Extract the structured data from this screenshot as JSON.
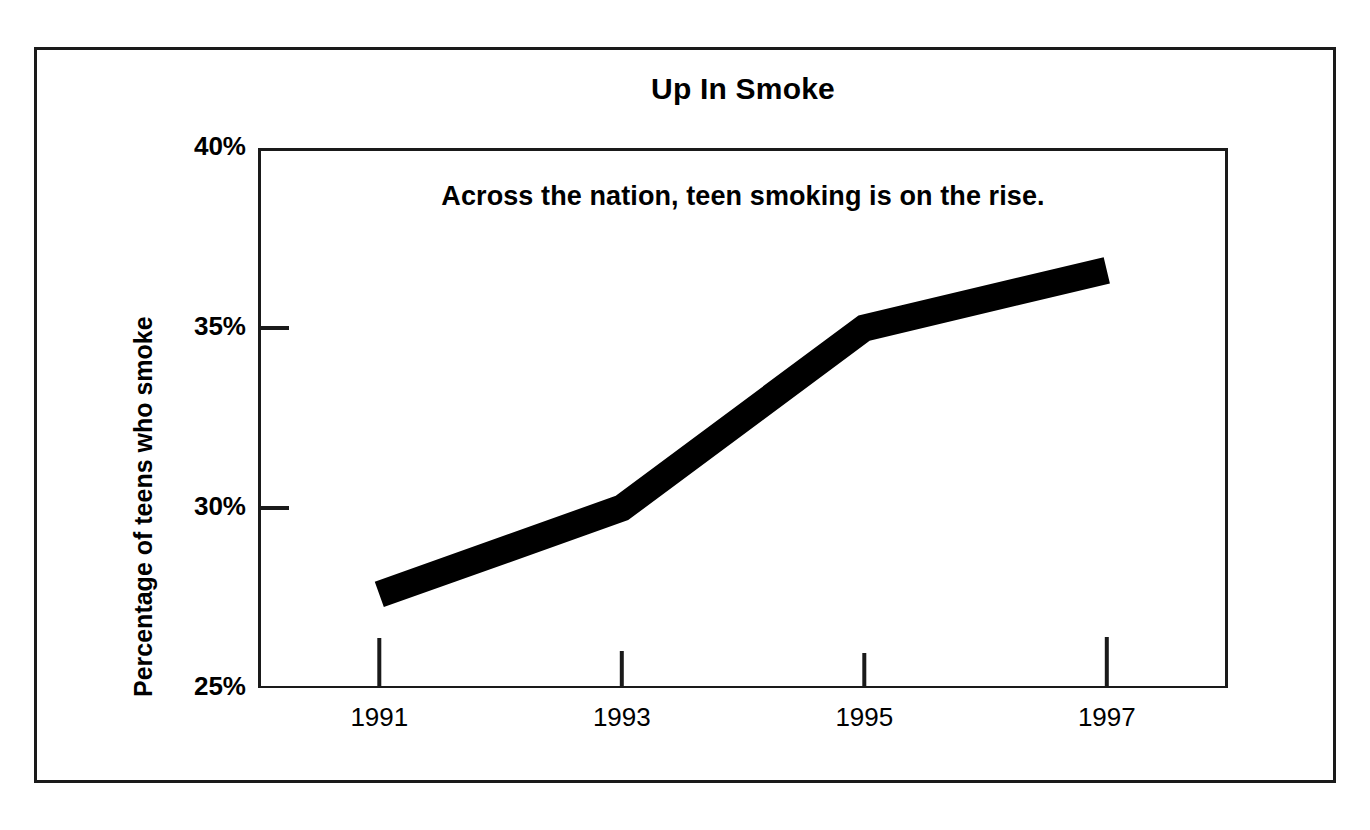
{
  "chart_data": {
    "type": "line",
    "title": "Up In Smoke",
    "annotation": "Across the nation, teen smoking is on the rise.",
    "xlabel": "",
    "ylabel": "Percentage of teens who smoke",
    "x": [
      1991,
      1993,
      1995,
      1997
    ],
    "categories": [
      "1991",
      "1993",
      "1995",
      "1997"
    ],
    "values": [
      27.6,
      30.0,
      35.0,
      36.6
    ],
    "series": [
      {
        "name": "Percentage of teens who smoke",
        "values": [
          27.6,
          30.0,
          35.0,
          36.6
        ]
      }
    ],
    "xlim": [
      1990.0,
      1998.0
    ],
    "ylim": [
      25,
      40
    ],
    "ytick_labels": [
      "40%",
      "35%",
      "30%",
      "25%"
    ],
    "ytick_values": [
      40,
      35,
      30,
      25
    ],
    "xtick_labels": [
      "1991",
      "1993",
      "1995",
      "1997"
    ],
    "xtick_values": [
      1991,
      1993,
      1995,
      1997
    ],
    "grid": false,
    "legend": false,
    "legend_position": "none",
    "line_color": "#000000",
    "line_width_px": 27,
    "axis_color": "#1a1a1a",
    "background_color": "#ffffff",
    "frame_color": "#1a1a1a"
  }
}
